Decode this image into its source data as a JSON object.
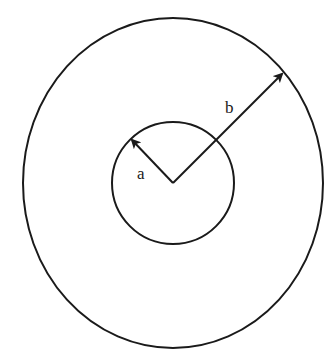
{
  "diagram": {
    "type": "concentric-circles",
    "stroke_color": "#1a1a1a",
    "background": "#ffffff",
    "outer_circle": {
      "label": "b",
      "cx": 173,
      "cy": 183,
      "rx": 150,
      "ry": 165
    },
    "inner_circle": {
      "label": "a",
      "cx": 173,
      "cy": 183,
      "r": 61
    },
    "labels": {
      "inner_radius": "a",
      "outer_radius": "b"
    }
  }
}
